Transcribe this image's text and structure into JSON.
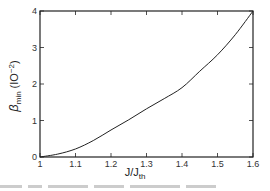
{
  "chart_data": {
    "type": "line",
    "title": "",
    "xlabel": "J/J_th",
    "xlabel_main": "J/J",
    "xlabel_sub": "th",
    "ylabel": "β_min (10^-2)",
    "ylabel_main": "β",
    "ylabel_sub": "min",
    "ylabel_unit": "(IO",
    "ylabel_exp": "−2",
    "ylabel_close": ")",
    "xlim": [
      1.0,
      1.6
    ],
    "ylim": [
      0,
      4
    ],
    "xticks": [
      "1",
      "1.1",
      "1.2",
      "1.3",
      "1.4",
      "1.5",
      "1.6"
    ],
    "yticks": [
      "0",
      "1",
      "2",
      "3",
      "4"
    ],
    "grid": false,
    "legend": null,
    "series": [
      {
        "name": "β_min",
        "x": [
          1.0,
          1.05,
          1.1,
          1.15,
          1.2,
          1.25,
          1.3,
          1.35,
          1.4,
          1.45,
          1.5,
          1.55,
          1.6
        ],
        "values": [
          0.0,
          0.08,
          0.22,
          0.45,
          0.74,
          1.02,
          1.32,
          1.6,
          1.9,
          2.35,
          2.8,
          3.35,
          4.0
        ]
      }
    ]
  }
}
